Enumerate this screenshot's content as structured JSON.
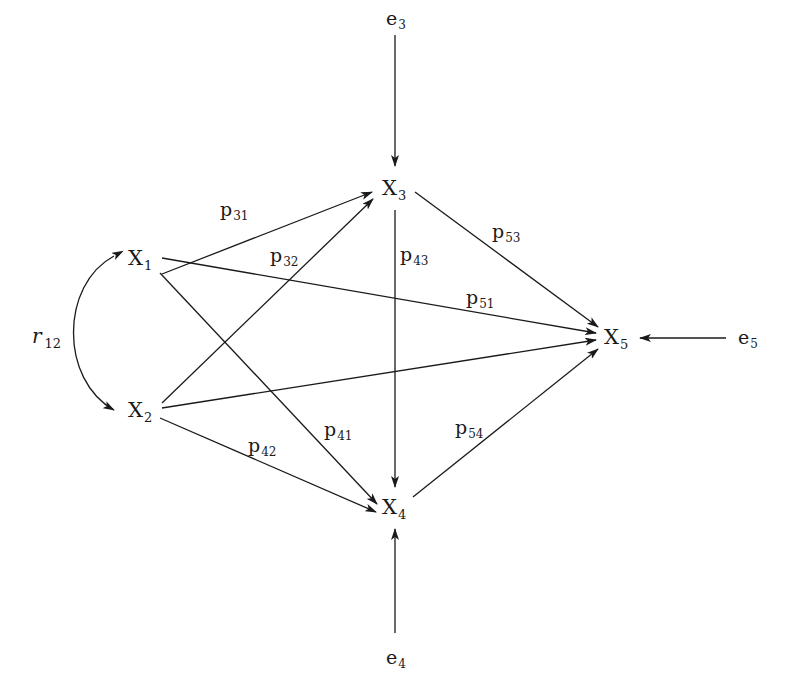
{
  "diagram": {
    "type": "path-diagram",
    "nodes": [
      {
        "id": "X1",
        "base": "X",
        "sub": "1"
      },
      {
        "id": "X2",
        "base": "X",
        "sub": "2"
      },
      {
        "id": "X3",
        "base": "X",
        "sub": "3"
      },
      {
        "id": "X4",
        "base": "X",
        "sub": "4"
      },
      {
        "id": "X5",
        "base": "X",
        "sub": "5"
      }
    ],
    "errors": [
      {
        "id": "e3",
        "base": "e",
        "sub": "3",
        "target": "X3"
      },
      {
        "id": "e4",
        "base": "e",
        "sub": "4",
        "target": "X4"
      },
      {
        "id": "e5",
        "base": "e",
        "sub": "5",
        "target": "X5"
      }
    ],
    "correlation": {
      "base": "r",
      "sub": "12",
      "between": [
        "X1",
        "X2"
      ]
    },
    "paths": [
      {
        "from": "X1",
        "to": "X3",
        "base": "p",
        "sub": "31"
      },
      {
        "from": "X2",
        "to": "X3",
        "base": "p",
        "sub": "32"
      },
      {
        "from": "X3",
        "to": "X4",
        "base": "p",
        "sub": "43"
      },
      {
        "from": "X3",
        "to": "X5",
        "base": "p",
        "sub": "53"
      },
      {
        "from": "X1",
        "to": "X5",
        "base": "p",
        "sub": "51"
      },
      {
        "from": "X1",
        "to": "X4",
        "base": "p",
        "sub": "41"
      },
      {
        "from": "X2",
        "to": "X4",
        "base": "p",
        "sub": "42"
      },
      {
        "from": "X4",
        "to": "X5",
        "base": "p",
        "sub": "54"
      },
      {
        "from": "X2",
        "to": "X5",
        "base": "",
        "sub": ""
      }
    ],
    "line_color": "#1a1a1a",
    "background": "#ffffff"
  }
}
